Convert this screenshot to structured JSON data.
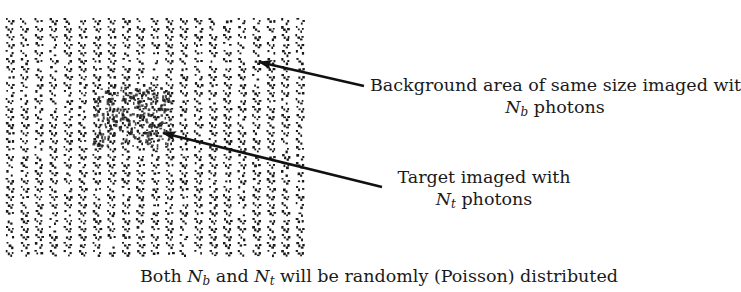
{
  "figure": {
    "pattern": {
      "description": "Random dot/noise texture of diagonal dash motifs in vertical columns",
      "columns": 21,
      "column_spacing_px": 14.5,
      "color": "#1a1a1a",
      "target_region": {
        "x": 92,
        "y": 85,
        "w": 80,
        "h": 60,
        "note": "denser cluster forming the target"
      }
    },
    "background_label": {
      "line1": "Background area of same size imaged with",
      "line2_symbol": "N",
      "line2_sub": "b",
      "line2_rest": " photons"
    },
    "target_label": {
      "line1": "Target imaged with",
      "line2_symbol": "N",
      "line2_sub": "t",
      "line2_rest": " photons"
    },
    "caption": {
      "prefix": "Both ",
      "sym1": "N",
      "sub1": "b",
      "mid": " and ",
      "sym2": "N",
      "sub2": "t",
      "suffix": " will be randomly (Poisson) distributed"
    },
    "arrows": [
      {
        "name": "background-arrow",
        "from": [
          364,
          86
        ],
        "to": [
          259,
          62
        ]
      },
      {
        "name": "target-arrow",
        "from": [
          382,
          187
        ],
        "to": [
          163,
          133
        ]
      }
    ]
  }
}
